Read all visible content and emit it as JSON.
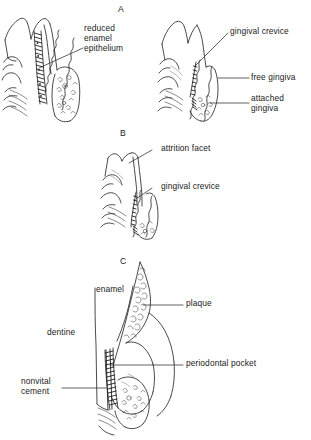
{
  "figure": {
    "background_color": "#ffffff",
    "ink_color": "#1d1d1d",
    "width": 311,
    "height": 440
  },
  "panels": [
    {
      "letter": "A",
      "subfigures": [
        {
          "position": "left",
          "labels": [
            {
              "id": "reduced-enamel-epithelium",
              "lines": [
                "reduced",
                "enamel",
                "epithelium"
              ],
              "text": "reduced enamel epithelium"
            }
          ]
        },
        {
          "position": "right",
          "labels": [
            {
              "id": "gingival-crevice",
              "lines": [
                "gingival crevice"
              ],
              "text": "gingival crevice"
            },
            {
              "id": "free-gingiva",
              "lines": [
                "free gingiva"
              ],
              "text": "free gingiva"
            },
            {
              "id": "attached-gingiva",
              "lines": [
                "attached",
                "gingiva"
              ],
              "text": "attached gingiva"
            }
          ]
        }
      ]
    },
    {
      "letter": "B",
      "subfigures": [
        {
          "position": "center",
          "labels": [
            {
              "id": "attrition-facet",
              "lines": [
                "attrition facet"
              ],
              "text": "attrition facet"
            },
            {
              "id": "gingival-crevice-b",
              "lines": [
                "gingival crevice"
              ],
              "text": "gingival crevice"
            }
          ]
        }
      ]
    },
    {
      "letter": "C",
      "subfigures": [
        {
          "position": "center",
          "labels": [
            {
              "id": "enamel",
              "lines": [
                "enamel"
              ],
              "text": "enamel"
            },
            {
              "id": "plaque",
              "lines": [
                "plaque"
              ],
              "text": "plaque"
            },
            {
              "id": "dentine",
              "lines": [
                "dentine"
              ],
              "text": "dentine"
            },
            {
              "id": "periodontal-pocket",
              "lines": [
                "periodontal pocket"
              ],
              "text": "periodontal pocket"
            },
            {
              "id": "nonvital-cement",
              "lines": [
                "nonvital",
                "cement"
              ],
              "text": "nonvital cement"
            }
          ]
        }
      ]
    }
  ],
  "labels": {
    "panel_a": "A",
    "panel_b": "B",
    "panel_c": "C",
    "reduced_enamel_epithelium_l1": "reduced",
    "reduced_enamel_epithelium_l2": "enamel",
    "reduced_enamel_epithelium_l3": "epithelium",
    "gingival_crevice_a": "gingival crevice",
    "free_gingiva": "free gingiva",
    "attached_gingiva_l1": "attached",
    "attached_gingiva_l2": "gingiva",
    "attrition_facet": "attrition facet",
    "gingival_crevice_b": "gingival crevice",
    "enamel": "enamel",
    "plaque": "plaque",
    "dentine": "dentine",
    "periodontal_pocket": "periodontal pocket",
    "nonvital_cement_l1": "nonvital",
    "nonvital_cement_l2": "cement"
  }
}
